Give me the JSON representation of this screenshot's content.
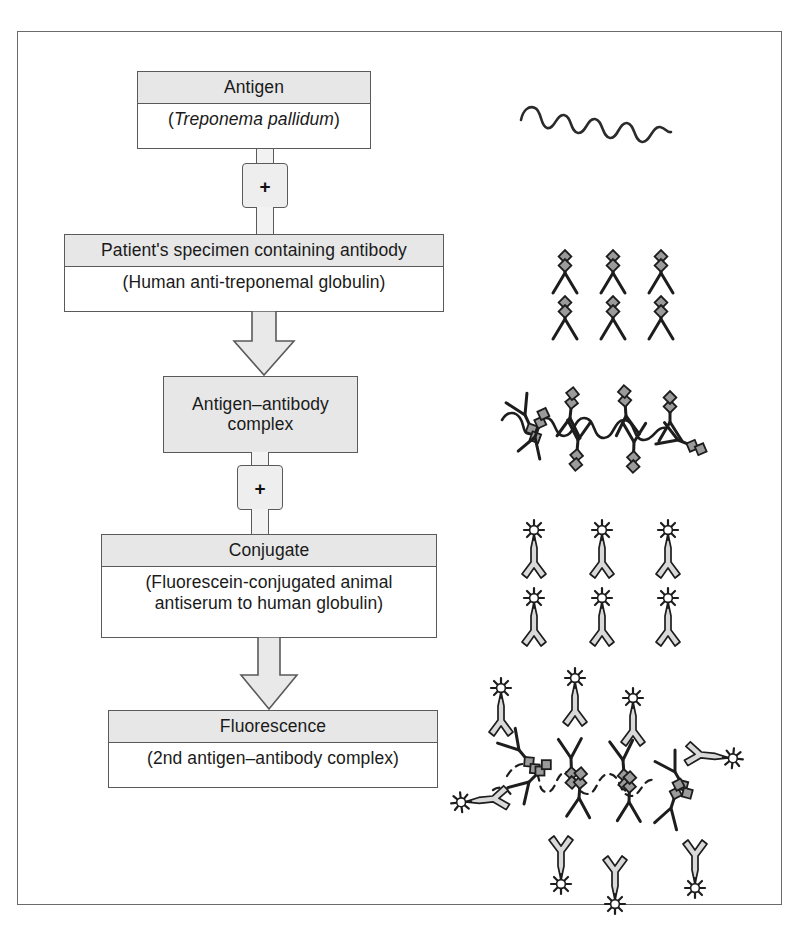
{
  "figure": {
    "frame_color": "#6b6b6b",
    "box_header_fill": "#e7e7e7",
    "box_body_fill": "#ffffff",
    "line_color": "#5a5a5a",
    "ink_color": "#1a1a1a"
  },
  "steps": [
    {
      "id": "antigen",
      "title": "Antigen",
      "subtitle_prefix": "(",
      "subtitle_italic": "Treponema pallidum",
      "subtitle_suffix": ")",
      "illustration": "spirochete-wave"
    },
    {
      "id": "specimen",
      "title": "Patient's specimen containing antibody",
      "subtitle": "(Human anti-treponemal globulin)",
      "illustration": "antibodies-six"
    },
    {
      "id": "complex",
      "title_line1": "Antigen–antibody",
      "title_line2": "complex",
      "illustration": "spirochete-with-antibodies"
    },
    {
      "id": "conjugate",
      "title": "Conjugate",
      "subtitle_line1": "(Fluorescein-conjugated animal",
      "subtitle_line2": "antiserum to human globulin)",
      "illustration": "fluorescent-conjugate-six"
    },
    {
      "id": "fluorescence",
      "title": "Fluorescence",
      "subtitle": "(2nd antigen–antibody complex)",
      "illustration": "fluorescent-complex"
    }
  ],
  "connectors": [
    {
      "id": "plus-1",
      "symbol": "+",
      "between": "antigen → specimen"
    },
    {
      "id": "arrow-1",
      "symbol": "↓",
      "between": "specimen → complex"
    },
    {
      "id": "plus-2",
      "symbol": "+",
      "between": "complex → conjugate"
    },
    {
      "id": "arrow-2",
      "symbol": "↓",
      "between": "conjugate → fluorescence"
    }
  ],
  "legend": {
    "spirochete": "Treponema pallidum spirochete",
    "antibody": "human anti-treponemal antibody",
    "conjugate": "fluorescein-labelled anti-human globulin"
  }
}
